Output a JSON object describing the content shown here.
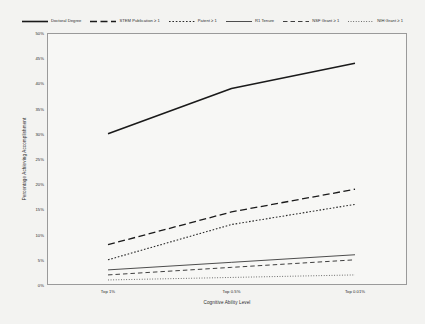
{
  "chart_data": {
    "type": "line",
    "title": "",
    "xlabel": "Cognitive Ability Level",
    "ylabel": "Percentage Achieving Accomplishment",
    "categories": [
      "Top 1%",
      "Top 0.5%",
      "Top 0.01%"
    ],
    "ylim": [
      0,
      50
    ],
    "yticks": [
      "0%",
      "5%",
      "10%",
      "15%",
      "20%",
      "25%",
      "30%",
      "35%",
      "40%",
      "45%",
      "50%"
    ],
    "ytick_values": [
      0,
      5,
      10,
      15,
      20,
      25,
      30,
      35,
      40,
      45,
      50
    ],
    "grid": false,
    "legend_position": "top",
    "series": [
      {
        "name": "Doctoral Degree",
        "values": [
          30.0,
          39.0,
          44.0
        ],
        "dash": "solid",
        "width": 1.6,
        "color": "#1a1a1a"
      },
      {
        "name": "STEM Publication ≥ 1",
        "values": [
          8.0,
          14.5,
          19.0
        ],
        "dash": "long-dash",
        "width": 1.3,
        "color": "#1a1a1a"
      },
      {
        "name": "Patent ≥ 1",
        "values": [
          5.0,
          12.0,
          16.0
        ],
        "dash": "dotted",
        "width": 1.1,
        "color": "#2a2a2a"
      },
      {
        "name": "R1 Tenure",
        "values": [
          3.0,
          4.5,
          6.0
        ],
        "dash": "solid",
        "width": 0.9,
        "color": "#3a3a3a"
      },
      {
        "name": "NSF Grant ≥ 1",
        "values": [
          2.0,
          3.5,
          5.0
        ],
        "dash": "dash",
        "width": 0.9,
        "color": "#2a2a2a"
      },
      {
        "name": "NIH Grant ≥ 1",
        "values": [
          1.0,
          1.5,
          2.0
        ],
        "dash": "fine-dotted",
        "width": 0.8,
        "color": "#3a3a3a"
      }
    ]
  }
}
